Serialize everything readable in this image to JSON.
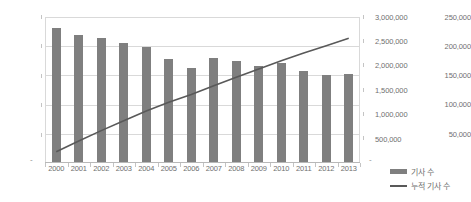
{
  "chart_data": {
    "type": "bar",
    "title": "",
    "xlabel": "",
    "ylabel": "",
    "grid": true,
    "legend_position": "right-bottom",
    "categories": [
      "2000",
      "2001",
      "2002",
      "2003",
      "2004",
      "2005",
      "2006",
      "2007",
      "2008",
      "2009",
      "2010",
      "2011",
      "2012",
      "2013"
    ],
    "series": [
      {
        "name": "기사 수",
        "type": "bar",
        "axis": "left",
        "color": "#7f7f7f",
        "values": [
          231000,
          220000,
          214000,
          205000,
          199000,
          178000,
          162000,
          180000,
          175000,
          166000,
          172000,
          158000,
          150000,
          152000
        ]
      },
      {
        "name": "누적 기사 수",
        "type": "line",
        "axis": "right",
        "color": "#595959",
        "values": [
          231000,
          451000,
          665000,
          870000,
          1069000,
          1247000,
          1409000,
          1589000,
          1764000,
          1930000,
          2102000,
          2260000,
          2410000,
          2562000
        ]
      }
    ],
    "axes": {
      "left": {
        "min": 0,
        "max": 250000,
        "step": 50000,
        "ticks": [
          "250,000",
          "200,000",
          "150,000",
          "100,000",
          "50,000",
          "-"
        ]
      },
      "right": {
        "min": 0,
        "max": 3000000,
        "step": 500000,
        "ticks": [
          "3,000,000",
          "2,500,000",
          "2,000,000",
          "1,500,000",
          "1,000,000",
          "500,000",
          "-"
        ]
      }
    }
  },
  "legend": {
    "bar_label": "기사 수",
    "line_label": "누적 기사 수"
  }
}
